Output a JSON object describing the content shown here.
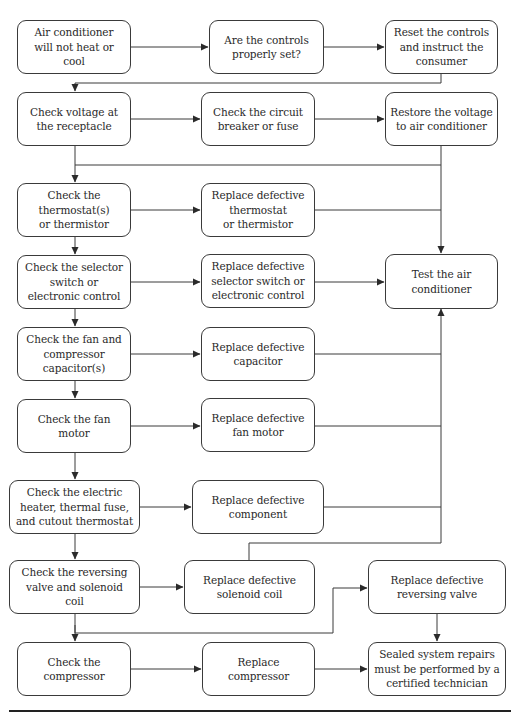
{
  "flowchart": {
    "title": "Air conditioner troubleshooting flowchart",
    "colors": {
      "stroke": "#3a3a3a",
      "text": "#2a2a2a",
      "background": "#ffffff"
    },
    "nodes": {
      "start": "Air conditioner\nwill not heat or\ncool",
      "controls_set": "Are the controls\nproperly set?",
      "reset_controls": "Reset the controls\nand instruct the\nconsumer",
      "check_voltage": "Check voltage at\nthe receptacle",
      "check_breaker": "Check the circuit\nbreaker or fuse",
      "restore_voltage": "Restore the voltage\nto air conditioner",
      "check_thermostat": "Check the\nthermostat(s)\nor thermistor",
      "replace_thermostat": "Replace defective\nthermostat\nor thermistor",
      "check_selector": "Check the selector\nswitch or\nelectronic control",
      "replace_selector": "Replace defective\nselector switch or\nelectronic control",
      "test_ac": "Test the air\nconditioner",
      "check_capacitor": "Check the fan and\ncompressor\ncapacitor(s)",
      "replace_capacitor": "Replace defective\ncapacitor",
      "check_fan_motor": "Check the fan\nmotor",
      "replace_fan_motor": "Replace defective\nfan motor",
      "check_heater": "Check the electric\nheater, thermal fuse,\nand cutout thermostat",
      "replace_component": "Replace defective\ncomponent",
      "check_reversing": "Check the reversing\nvalve and solenoid\ncoil",
      "replace_solenoid": "Replace defective\nsolenoid coil",
      "replace_reversing": "Replace defective\nreversing valve",
      "check_compressor": "Check the\ncompressor",
      "replace_compressor": "Replace\ncompressor",
      "sealed_repairs": "Sealed system repairs\nmust be performed by a\ncertified technician"
    }
  }
}
